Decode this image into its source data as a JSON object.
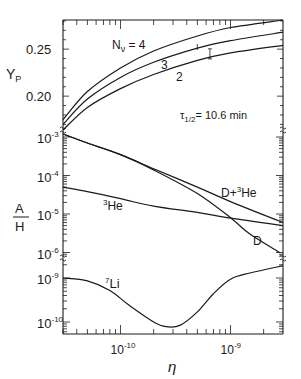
{
  "chart_data": {
    "type": "line",
    "title": "",
    "xlabel": "η",
    "xscale": "log",
    "xlim": [
      3e-11,
      3e-09
    ],
    "x_ticks": [
      {
        "value": 1e-10,
        "label_base": "10",
        "label_exp": "-10"
      },
      {
        "value": 1e-09,
        "label_base": "10",
        "label_exp": "-9"
      }
    ],
    "panels": [
      {
        "name": "helium-4",
        "ylabel": "Y",
        "ylabel_sub": "P",
        "yscale": "linear",
        "ylim": [
          0.164,
          0.281
        ],
        "y_ticks": [
          {
            "value": 0.2,
            "label": "0.20"
          },
          {
            "value": 0.25,
            "label": "0.25"
          }
        ],
        "annotation": {
          "text": "τ",
          "sub": "1/2",
          "rest": "= 10.6 min"
        },
        "series": [
          {
            "name": "N_ν = 4",
            "label": "N",
            "label_sub": "ν",
            "label_rest": " = 4",
            "x": [
              3e-11,
              5e-11,
              1e-10,
              2e-10,
              5e-10,
              1e-09,
              3e-09
            ],
            "values": [
              0.175,
              0.205,
              0.23,
              0.248,
              0.264,
              0.273,
              0.281
            ]
          },
          {
            "name": "N_ν = 3",
            "label": "3",
            "x": [
              3e-11,
              5e-11,
              1e-10,
              2e-10,
              5e-10,
              1e-09,
              3e-09
            ],
            "values": [
              0.17,
              0.197,
              0.22,
              0.236,
              0.251,
              0.259,
              0.268
            ]
          },
          {
            "name": "N_ν = 2",
            "label": "2",
            "x": [
              3e-11,
              5e-11,
              1e-10,
              2e-10,
              5e-10,
              1e-09,
              3e-09
            ],
            "values": [
              0.164,
              0.188,
              0.208,
              0.223,
              0.238,
              0.246,
              0.254
            ]
          }
        ],
        "error_bar": {
          "label": "I",
          "x": 6.5e-10,
          "y": 0.245
        }
      },
      {
        "name": "deuterium-helium-3",
        "ylabel_num": "A",
        "ylabel_den": "H",
        "yscale": "log",
        "ylim": [
          1e-06,
          0.0012
        ],
        "y_ticks": [
          {
            "value": 0.001,
            "label_base": "10",
            "label_exp": "-3"
          },
          {
            "value": 0.0001,
            "label_base": "10",
            "label_exp": "-4"
          },
          {
            "value": 1e-05,
            "label_base": "10",
            "label_exp": "-5"
          },
          {
            "value": 1e-06,
            "label_base": "10",
            "label_exp": "-6"
          }
        ],
        "series": [
          {
            "name": "D+3He",
            "label": "D+",
            "label_sup": "3",
            "label_rest": "He",
            "x": [
              3e-11,
              5e-11,
              1e-10,
              2e-10,
              5e-10,
              1e-09,
              3e-09
            ],
            "values": [
              0.0012,
              0.0007,
              0.00035,
              0.00015,
              5e-05,
              2.1e-05,
              6e-06
            ]
          },
          {
            "name": "D",
            "label": "D",
            "x": [
              3e-11,
              5e-11,
              1e-10,
              2e-10,
              5e-10,
              1e-09,
              1.5e-09,
              2.8e-09
            ],
            "values": [
              0.0012,
              0.0007,
              0.00035,
              0.00014,
              3.4e-05,
              8e-06,
              3e-06,
              1e-06
            ]
          },
          {
            "name": "3He",
            "label": "",
            "label_sup": "3",
            "label_rest": "He",
            "x": [
              3e-11,
              5e-11,
              1e-10,
              2e-10,
              5e-10,
              1e-09,
              3e-09
            ],
            "values": [
              5e-05,
              3.8e-05,
              2.5e-05,
              1.6e-05,
              1.1e-05,
              7.8e-06,
              5e-06
            ]
          }
        ]
      },
      {
        "name": "lithium-7",
        "yscale": "log",
        "ylim": [
          6.5e-11,
          3e-09
        ],
        "y_ticks": [
          {
            "value": 1e-09,
            "label_base": "10",
            "label_exp": "-9"
          },
          {
            "value": 1e-10,
            "label_base": "10",
            "label_exp": "-10"
          }
        ],
        "series": [
          {
            "name": "7Li",
            "label_sup": "7",
            "label_rest": "Li",
            "x": [
              3e-11,
              5e-11,
              8e-11,
              1.2e-10,
              2e-10,
              2.6e-10,
              3.5e-10,
              5e-10,
              7e-10,
              1e-09,
              1.5e-09,
              3e-09
            ],
            "values": [
              1e-09,
              8.6e-10,
              5.2e-10,
              2.4e-10,
              1e-10,
              7.8e-11,
              8.5e-11,
              1.7e-10,
              4.4e-10,
              9.4e-10,
              1.3e-09,
              1.9e-09
            ]
          }
        ]
      }
    ],
    "grid": false,
    "legend": "inline labels"
  }
}
